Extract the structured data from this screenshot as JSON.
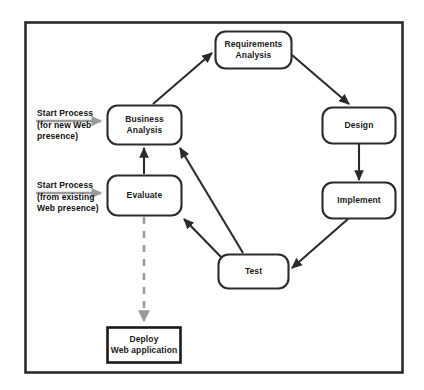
{
  "diagram": {
    "frame": {
      "name": "outer-border"
    },
    "colors": {
      "stroke": "#2b2b2b",
      "text": "#141414",
      "gray_arrow": "#8a8a8a",
      "background": "#ffffff"
    },
    "nodes": [
      {
        "id": "requirements-analysis",
        "lines": [
          "Requirements",
          "Analysis"
        ],
        "shape": "rounded-rect"
      },
      {
        "id": "design",
        "lines": [
          "Design"
        ],
        "shape": "rounded-rect"
      },
      {
        "id": "implement",
        "lines": [
          "Implement"
        ],
        "shape": "rounded-rect"
      },
      {
        "id": "test",
        "lines": [
          "Test"
        ],
        "shape": "rounded-rect"
      },
      {
        "id": "business-analysis",
        "lines": [
          "Business",
          "Analysis"
        ],
        "shape": "rounded-rect"
      },
      {
        "id": "evaluate",
        "lines": [
          "Evaluate"
        ],
        "shape": "rounded-rect"
      },
      {
        "id": "deploy",
        "lines": [
          "Deploy",
          "Web application"
        ],
        "shape": "rect"
      }
    ],
    "entry_labels": [
      {
        "id": "start-new",
        "lines": [
          "Start Process",
          "(for new Web",
          "presence)"
        ]
      },
      {
        "id": "start-existing",
        "lines": [
          "Start Process",
          "(from existing",
          "Web presence)"
        ]
      }
    ],
    "edges": [
      {
        "from": "business-analysis",
        "to": "requirements-analysis",
        "style": "solid"
      },
      {
        "from": "requirements-analysis",
        "to": "design",
        "style": "solid"
      },
      {
        "from": "design",
        "to": "implement",
        "style": "solid"
      },
      {
        "from": "implement",
        "to": "test",
        "style": "solid"
      },
      {
        "from": "test",
        "to": "business-analysis",
        "style": "solid"
      },
      {
        "from": "test",
        "to": "evaluate",
        "style": "solid"
      },
      {
        "from": "evaluate",
        "to": "business-analysis",
        "style": "solid"
      },
      {
        "from": "start-new",
        "to": "business-analysis",
        "style": "solid-gray"
      },
      {
        "from": "start-existing",
        "to": "evaluate",
        "style": "solid-gray"
      },
      {
        "from": "evaluate",
        "to": "deploy",
        "style": "dashed-gray"
      }
    ]
  }
}
